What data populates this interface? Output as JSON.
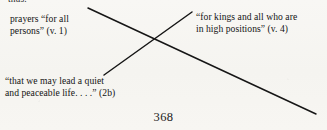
{
  "page": {
    "page_number": "368",
    "clipped_text_above": "thus.",
    "ink_color": "#141414",
    "paper_color": "#f7f6f3"
  },
  "diagram": {
    "type": "chiasm-crossing-lines",
    "labels": [
      {
        "id": "prayers",
        "position": "top-left",
        "lines": [
          "prayers “for all",
          "persons” (v. 1)"
        ]
      },
      {
        "id": "kings",
        "position": "top-right",
        "lines": [
          "“for kings and all who are",
          "in high positions” (v. 4)"
        ]
      },
      {
        "id": "quiet",
        "position": "bottom-left",
        "lines": [
          "“that we may lead a quiet",
          "and peaceable life. . . .” (2b)"
        ]
      }
    ],
    "connectors": [
      {
        "id": "descending",
        "from_x": 88,
        "from_y": 8,
        "to_x": 316,
        "to_y": 114,
        "stroke": "#161616",
        "width": 1.5
      },
      {
        "id": "ascending",
        "from_x": 104,
        "from_y": 75,
        "to_x": 192,
        "to_y": 12,
        "stroke": "#161616",
        "width": 1.5
      }
    ],
    "crossing_point": {
      "x": 155,
      "y": 42
    }
  }
}
